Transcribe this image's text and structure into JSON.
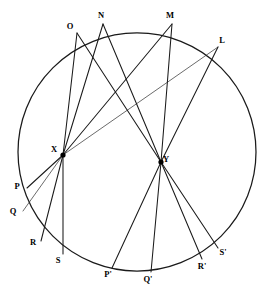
{
  "figure": {
    "background_color": "#ffffff",
    "stroke_color": "#1a1a1a",
    "width": 277,
    "height": 297
  },
  "chart_data": {
    "type": "scatter",
    "xlabel": "",
    "ylabel": "",
    "xlim": [
      0,
      277
    ],
    "ylim": [
      0,
      297
    ],
    "grid": false,
    "legend": "none",
    "circle": {
      "center_x": 137,
      "center_y": 152,
      "radius": 119,
      "label": "circle"
    },
    "points": [
      {
        "label": "O",
        "x": 77,
        "y": 33,
        "on_circle": true,
        "label_dx": -7,
        "label_dy": -4
      },
      {
        "label": "N",
        "x": 103,
        "y": 24,
        "on_circle": true,
        "label_dx": -2,
        "label_dy": -6
      },
      {
        "label": "M",
        "x": 172,
        "y": 24,
        "on_circle": true,
        "label_dx": -2,
        "label_dy": -6
      },
      {
        "label": "L",
        "x": 218,
        "y": 47,
        "on_circle": true,
        "label_dx": 4,
        "label_dy": -4
      },
      {
        "label": "P",
        "x": 27,
        "y": 188,
        "on_circle": true,
        "label_dx": -10,
        "label_dy": 1
      },
      {
        "label": "Q",
        "x": 23,
        "y": 211,
        "on_circle": true,
        "label_dx": -10,
        "label_dy": 3
      },
      {
        "label": "R",
        "x": 41,
        "y": 241,
        "on_circle": true,
        "label_dx": -8,
        "label_dy": 4
      },
      {
        "label": "S",
        "x": 63,
        "y": 254,
        "on_circle": true,
        "label_dx": -5,
        "label_dy": 9
      },
      {
        "label": "P'",
        "x": 112,
        "y": 268,
        "on_circle": true,
        "label_dx": -4,
        "label_dy": 9
      },
      {
        "label": "Q'",
        "x": 151,
        "y": 272,
        "on_circle": true,
        "label_dx": -3,
        "label_dy": 10
      },
      {
        "label": "R'",
        "x": 202,
        "y": 259,
        "on_circle": true,
        "label_dx": 0,
        "label_dy": 10
      },
      {
        "label": "S'",
        "x": 218,
        "y": 248,
        "on_circle": true,
        "label_dx": 5,
        "label_dy": 7
      },
      {
        "label": "X",
        "x": 63,
        "y": 155,
        "on_circle": false,
        "label_dx": -9,
        "label_dy": -3,
        "hub": true
      },
      {
        "label": "Y",
        "x": 161,
        "y": 162,
        "on_circle": false,
        "label_dx": 5,
        "label_dy": 0,
        "hub": true
      }
    ],
    "segments": [
      {
        "from": "X",
        "to": "O",
        "weight": "normal"
      },
      {
        "from": "X",
        "to": "N",
        "weight": "normal"
      },
      {
        "from": "X",
        "to": "M",
        "weight": "normal"
      },
      {
        "from": "X",
        "to": "L",
        "weight": "thin"
      },
      {
        "from": "X",
        "to": "P",
        "weight": "normal"
      },
      {
        "from": "X",
        "to": "Q",
        "weight": "thin"
      },
      {
        "from": "X",
        "to": "R",
        "weight": "normal"
      },
      {
        "from": "X",
        "to": "S",
        "weight": "normal"
      },
      {
        "from": "Y",
        "to": "O",
        "weight": "normal"
      },
      {
        "from": "Y",
        "to": "N",
        "weight": "normal"
      },
      {
        "from": "Y",
        "to": "M",
        "weight": "normal"
      },
      {
        "from": "Y",
        "to": "L",
        "weight": "normal"
      },
      {
        "from": "Y",
        "to": "P'",
        "weight": "normal"
      },
      {
        "from": "Y",
        "to": "Q'",
        "weight": "normal"
      },
      {
        "from": "Y",
        "to": "R'",
        "weight": "normal"
      },
      {
        "from": "Y",
        "to": "S'",
        "weight": "normal"
      }
    ],
    "hub_points": [
      "X",
      "Y"
    ],
    "upper_points": [
      "O",
      "N",
      "M",
      "L"
    ],
    "lower_left_points": [
      "P",
      "Q",
      "R",
      "S"
    ],
    "lower_right_points": [
      "P'",
      "Q'",
      "R'",
      "S'"
    ]
  }
}
